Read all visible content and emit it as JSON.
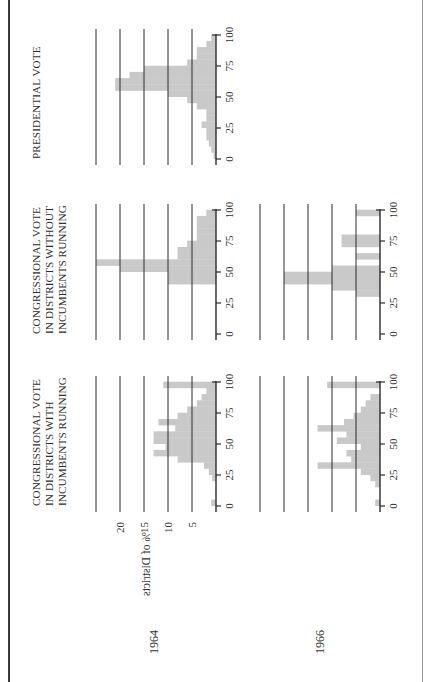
{
  "chart_data": {
    "type": "bar",
    "column_titles": [
      [
        "CONGRESSIONAL VOTE",
        "IN DISTRICTS WITH",
        "INCUMBENTS RUNNING"
      ],
      [
        "CONGRESSIONAL VOTE",
        "IN DISTRICTS WITHOUT",
        "INCUMBENTS RUNNING"
      ],
      [
        "PRESIDENTIAL VOTE"
      ]
    ],
    "row_labels": [
      "1964",
      "1966"
    ],
    "ylabel": "% of Districts",
    "y_ticks": [
      5,
      10,
      15,
      20
    ],
    "ylim": [
      0,
      25
    ],
    "x_ticks": [
      0,
      25,
      50,
      75,
      100
    ],
    "xlim": [
      0,
      100
    ],
    "bin_width": 5,
    "panels": [
      {
        "id": "1964-with-incumbents",
        "year": "1964",
        "column": "CONGRESSIONAL VOTE IN DISTRICTS WITH INCUMBENTS RUNNING",
        "bins": [
          0,
          5,
          10,
          15,
          20,
          25,
          30,
          35,
          40,
          45,
          50,
          55,
          60,
          65,
          70,
          75,
          80,
          85,
          90,
          95
        ],
        "values": [
          1,
          0,
          0,
          0,
          0.8,
          1.5,
          2.5,
          8,
          13,
          10.5,
          13,
          13,
          8.5,
          12,
          8,
          6,
          4,
          3,
          2,
          11
        ]
      },
      {
        "id": "1964-without-incumbents",
        "year": "1964",
        "column": "CONGRESSIONAL VOTE IN DISTRICTS WITHOUT INCUMBENTS RUNNING",
        "bins": [
          0,
          5,
          10,
          15,
          20,
          25,
          30,
          35,
          40,
          45,
          50,
          55,
          60,
          65,
          70,
          75,
          80,
          85,
          90,
          95
        ],
        "values": [
          0,
          0,
          0,
          0,
          0,
          0,
          0,
          0,
          10,
          10,
          20,
          25,
          8,
          8,
          6,
          4,
          4,
          4,
          4,
          2
        ]
      },
      {
        "id": "1966-with-incumbents",
        "year": "1966",
        "column": "CONGRESSIONAL VOTE IN DISTRICTS WITH INCUMBENTS RUNNING",
        "bins": [
          0,
          5,
          10,
          15,
          20,
          25,
          30,
          35,
          40,
          45,
          50,
          55,
          60,
          65,
          70,
          75,
          80,
          85,
          90,
          95
        ],
        "values": [
          1,
          0,
          0,
          1,
          2,
          4,
          13,
          6,
          7,
          4,
          9,
          7,
          13,
          7.5,
          5.5,
          4,
          3,
          2,
          0,
          11
        ]
      },
      {
        "id": "1966-without-incumbents",
        "year": "1966",
        "column": "CONGRESSIONAL VOTE IN DISTRICTS WITHOUT INCUMBENTS RUNNING",
        "bins": [
          0,
          5,
          10,
          15,
          20,
          25,
          30,
          35,
          40,
          45,
          50,
          55,
          60,
          65,
          70,
          75,
          80,
          85,
          90,
          95
        ],
        "values": [
          0,
          0,
          0,
          0,
          0,
          0,
          5,
          10,
          20,
          20,
          10,
          0,
          5,
          0,
          8,
          8,
          0,
          0,
          0,
          5
        ]
      },
      {
        "id": "1964-presidential",
        "year": "1964",
        "column": "PRESIDENTIAL VOTE",
        "bins": [
          0,
          5,
          10,
          15,
          20,
          25,
          30,
          35,
          40,
          45,
          50,
          55,
          60,
          65,
          70,
          75,
          80,
          85,
          90,
          95
        ],
        "values": [
          0.5,
          1,
          1.5,
          2,
          2,
          3,
          2,
          2,
          4,
          6,
          10,
          21,
          21,
          18,
          15,
          6,
          4,
          4,
          2,
          1
        ]
      }
    ],
    "grid": true,
    "bar_color": "#c9c9c9"
  },
  "figure": {
    "rotation_deg": -90,
    "bar_color": "#c9c9c9",
    "line_color": "#2b2b2b"
  }
}
